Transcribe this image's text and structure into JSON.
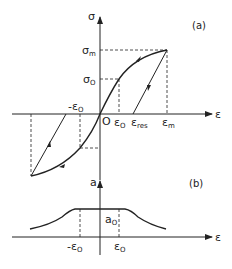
{
  "panel_a": {
    "tag": "(a)",
    "y_axis_label": "σ",
    "x_axis_label": "ε",
    "origin_label": "O",
    "labels": {
      "sigma_m": {
        "base": "σ",
        "sub": "m"
      },
      "sigma_0": {
        "base": "σ",
        "sub": "O"
      },
      "eps_0": {
        "base": "ε",
        "sub": "O"
      },
      "neg_eps_0": {
        "base": "-ε",
        "sub": "O"
      },
      "eps_res": {
        "base": "ε",
        "sub": "res"
      },
      "eps_m": {
        "base": "ε",
        "sub": "m"
      }
    }
  },
  "panel_b": {
    "tag": "(b)",
    "y_axis_label": "a",
    "x_axis_label": "ε",
    "labels": {
      "a_0": {
        "base": "a",
        "sub": "O"
      },
      "neg_eps_0": {
        "base": "-ε",
        "sub": "O"
      },
      "eps_0": {
        "base": "ε",
        "sub": "O"
      }
    }
  },
  "colors": {
    "line": "#222222",
    "background": "#ffffff"
  }
}
